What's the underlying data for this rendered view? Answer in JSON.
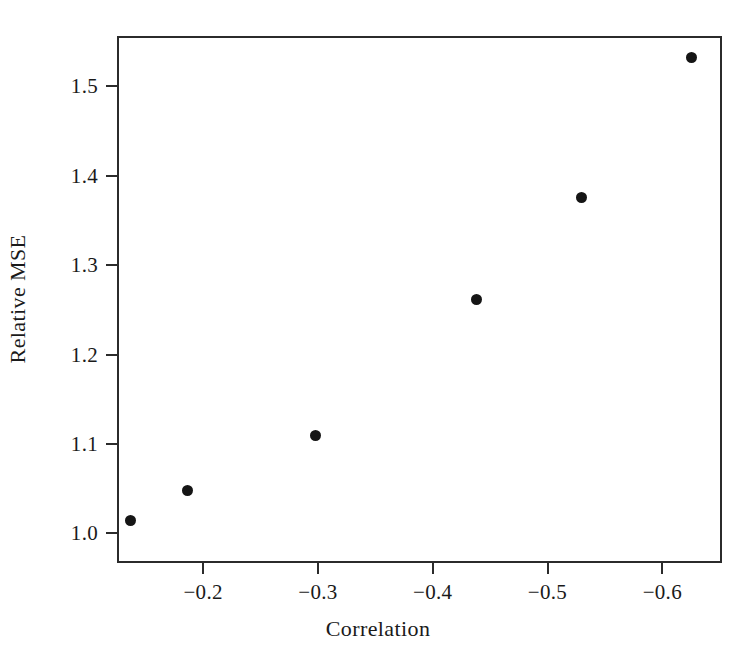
{
  "chart_data": {
    "type": "scatter",
    "title": "",
    "xlabel": "Correlation",
    "ylabel": "Relative MSE",
    "xlim": [
      -0.125,
      -0.652
    ],
    "ylim": [
      0.967,
      1.556
    ],
    "grid": false,
    "legend": null,
    "xticks": [
      -0.2,
      -0.3,
      -0.4,
      -0.5,
      -0.6
    ],
    "xticklabels": [
      "−0.2",
      "−0.3",
      "−0.4",
      "−0.5",
      "−0.6"
    ],
    "yticks": [
      1.0,
      1.1,
      1.2,
      1.3,
      1.4,
      1.5
    ],
    "yticklabels": [
      "1.0",
      "1.1",
      "1.2",
      "1.3",
      "1.4",
      "1.5"
    ],
    "marker": "filled-circle",
    "marker_color": "#151515",
    "marker_size": 11,
    "x": [
      -0.137,
      -0.186,
      -0.298,
      -0.438,
      -0.53,
      -0.625
    ],
    "y": [
      1.014,
      1.048,
      1.109,
      1.262,
      1.375,
      1.532
    ],
    "points": [
      {
        "x": -0.137,
        "y": 1.014
      },
      {
        "x": -0.186,
        "y": 1.048
      },
      {
        "x": -0.298,
        "y": 1.109
      },
      {
        "x": -0.438,
        "y": 1.262
      },
      {
        "x": -0.53,
        "y": 1.375
      },
      {
        "x": -0.625,
        "y": 1.532
      }
    ]
  },
  "figure": {
    "background": "#ffffff",
    "axis_color": "#2b2b2b"
  }
}
